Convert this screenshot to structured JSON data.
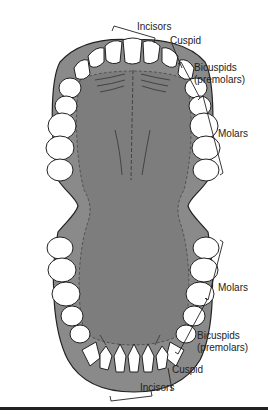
{
  "diagram": {
    "colors": {
      "gum": "#8a8a8a",
      "palate": "#7d7d7d",
      "tooth": "#ffffff",
      "outline": "#222222",
      "rule": "#222222"
    },
    "labels": {
      "upper_incisors": "Incisors",
      "upper_cuspid": "Cuspid",
      "upper_bicuspids_1": "Bicuspids",
      "upper_bicuspids_2": "(premolars)",
      "upper_molars": "Molars",
      "lower_molars": "Molars",
      "lower_bicuspids_1": "Bicuspids",
      "lower_bicuspids_2": "(premolars)",
      "lower_cuspid": "Cuspid",
      "lower_incisors": "Incisors"
    }
  }
}
